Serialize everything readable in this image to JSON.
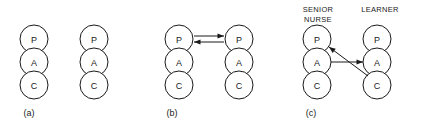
{
  "figure": {
    "kind": "transactional-analysis-ego-state-diagram",
    "geometry": {
      "width": 422,
      "height": 132,
      "circle_radius": 14,
      "row_centers_y": [
        39,
        62,
        85
      ],
      "label_y": 116
    },
    "panels": [
      {
        "id": "a",
        "label": "(a)",
        "label_x": 29,
        "columns": [
          {
            "id": "a-left",
            "cx": 34,
            "role": null,
            "states": [
              {
                "letter": "P",
                "name": "Parent"
              },
              {
                "letter": "A",
                "name": "Adult"
              },
              {
                "letter": "C",
                "name": "Child"
              }
            ]
          },
          {
            "id": "a-right",
            "cx": 94,
            "role": null,
            "states": [
              {
                "letter": "P",
                "name": "Parent"
              },
              {
                "letter": "A",
                "name": "Adult"
              },
              {
                "letter": "C",
                "name": "Child"
              }
            ]
          }
        ],
        "transactions": []
      },
      {
        "id": "b",
        "label": "(b)",
        "label_x": 172,
        "columns": [
          {
            "id": "b-left",
            "cx": 179,
            "role": null,
            "states": [
              {
                "letter": "P",
                "name": "Parent"
              },
              {
                "letter": "A",
                "name": "Adult"
              },
              {
                "letter": "C",
                "name": "Child"
              }
            ]
          },
          {
            "id": "b-right",
            "cx": 239,
            "role": null,
            "states": [
              {
                "letter": "P",
                "name": "Parent"
              },
              {
                "letter": "A",
                "name": "Adult"
              },
              {
                "letter": "C",
                "name": "Child"
              }
            ]
          }
        ],
        "transactions": [
          {
            "id": "b-stimulus",
            "kind": "complementary",
            "from": "left-parent",
            "to": "right-parent",
            "x1": 194,
            "y1": 36,
            "x2": 224,
            "y2": 36,
            "arrow": "end"
          },
          {
            "id": "b-response",
            "kind": "complementary",
            "from": "right-parent",
            "to": "left-parent",
            "x1": 224,
            "y1": 42,
            "x2": 194,
            "y2": 42,
            "arrow": "end"
          }
        ]
      },
      {
        "id": "c",
        "label": "(c)",
        "label_x": 311,
        "columns": [
          {
            "id": "c-left",
            "cx": 317,
            "role": "SENIOR NURSE",
            "role_lines": [
              "SENIOR",
              "NURSE"
            ],
            "role_x": 318,
            "states": [
              {
                "letter": "P",
                "name": "Parent"
              },
              {
                "letter": "A",
                "name": "Adult"
              },
              {
                "letter": "C",
                "name": "Child"
              }
            ]
          },
          {
            "id": "c-right",
            "cx": 377,
            "role": "LEARNER",
            "role_lines": [
              "LEARNER"
            ],
            "role_x": 380,
            "states": [
              {
                "letter": "P",
                "name": "Parent"
              },
              {
                "letter": "A",
                "name": "Adult"
              },
              {
                "letter": "C",
                "name": "Child"
              }
            ]
          }
        ],
        "transactions": [
          {
            "id": "c-stimulus",
            "kind": "crossed",
            "from": "left-adult",
            "to": "right-adult",
            "x1": 331,
            "y1": 62,
            "x2": 363,
            "y2": 62,
            "arrow": "end"
          },
          {
            "id": "c-response",
            "kind": "crossed",
            "from": "right-child",
            "to": "left-parent",
            "x1": 368,
            "y1": 76,
            "x2": 329,
            "y2": 47,
            "arrow": "end"
          }
        ]
      }
    ]
  }
}
